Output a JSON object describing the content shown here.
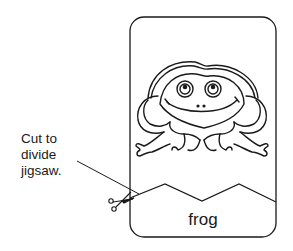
{
  "instruction": {
    "lines": [
      "Cut to",
      "divide",
      "jigsaw."
    ]
  },
  "card": {
    "word": "frog",
    "picture": "frog-illustration"
  },
  "icons": {
    "scissors": "scissors-icon"
  },
  "colors": {
    "line": "#1a1a1a",
    "background": "#ffffff"
  }
}
